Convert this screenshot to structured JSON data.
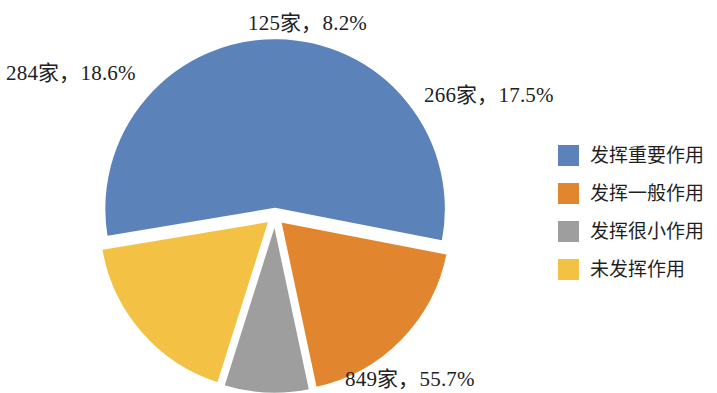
{
  "chart_data": {
    "type": "pie",
    "title": "",
    "subtitle": "",
    "xlabel": "",
    "ylabel": "",
    "grid": false,
    "legend_position": "right",
    "unit_suffix": "家",
    "total": 1524,
    "categories": [
      "发挥重要作用",
      "发挥一般作用",
      "发挥很小作用",
      "未发挥作用"
    ],
    "values": [
      849,
      284,
      125,
      266
    ],
    "percents": [
      55.7,
      18.6,
      8.2,
      17.5
    ],
    "colors": [
      "#5b82b9",
      "#e1862f",
      "#9e9e9e",
      "#f3c245"
    ],
    "data_labels": [
      "849家，55.7%",
      "284家，18.6%",
      "125家，8.2%",
      "266家，17.5%"
    ],
    "slices": [
      {
        "name": "发挥重要作用",
        "count": 849,
        "percent": 55.7,
        "color": "#5b82b9",
        "label": "849家，55.7%"
      },
      {
        "name": "发挥一般作用",
        "count": 284,
        "percent": 18.6,
        "color": "#e1862f",
        "label": "284家，18.6%"
      },
      {
        "name": "发挥很小作用",
        "count": 125,
        "percent": 8.2,
        "color": "#9e9e9e",
        "label": "125家，8.2%"
      },
      {
        "name": "未发挥作用",
        "count": 266,
        "percent": 17.5,
        "color": "#f3c245",
        "label": "266家，17.5%"
      }
    ]
  },
  "legend": {
    "items": [
      {
        "label": "发挥重要作用",
        "color": "#5b82b9"
      },
      {
        "label": "发挥一般作用",
        "color": "#e1862f"
      },
      {
        "label": "发挥很小作用",
        "color": "#9e9e9e"
      },
      {
        "label": "未发挥作用",
        "color": "#f3c245"
      }
    ]
  },
  "labels": {
    "gray": "125家，8.2%",
    "orange": "284家，18.6%",
    "yellow": "266家，17.5%",
    "blue": "849家，55.7%"
  }
}
